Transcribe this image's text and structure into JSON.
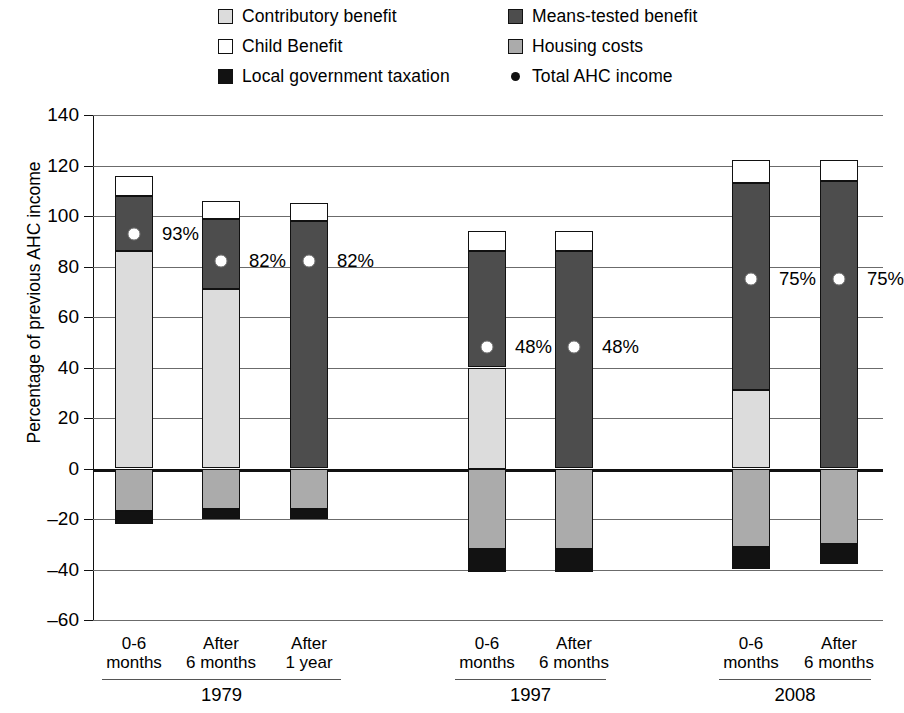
{
  "legend": {
    "items": [
      {
        "label": "Contributory benefit",
        "key": "contributory",
        "swatch": "square",
        "color": "#dcdcdc"
      },
      {
        "label": "Means-tested benefit",
        "key": "means",
        "swatch": "square",
        "color": "#4d4d4d"
      },
      {
        "label": "Child Benefit",
        "key": "child",
        "swatch": "square",
        "color": "#ffffff"
      },
      {
        "label": "Housing costs",
        "key": "housing",
        "swatch": "square",
        "color": "#ababab"
      },
      {
        "label": "Local government taxation",
        "key": "taxation",
        "swatch": "square",
        "color": "#121212"
      },
      {
        "label": "Total AHC income",
        "key": "ahc",
        "swatch": "dot",
        "color": "#111111"
      }
    ]
  },
  "chart_data": {
    "type": "bar",
    "title": "",
    "xlabel": "",
    "ylabel": "Percentage of previous AHC income",
    "ylim": [
      -60,
      140
    ],
    "yticks": [
      140,
      120,
      100,
      80,
      60,
      40,
      20,
      0,
      -20,
      -40,
      -60
    ],
    "ytick_labels": [
      "140",
      "120",
      "100",
      "80",
      "60",
      "40",
      "20",
      "0",
      "–20",
      "–40",
      "–60"
    ],
    "grid": true,
    "stacked": true,
    "legend_position": "top",
    "categories": [
      "0-6 months",
      "After 6 months",
      "After 1 year",
      "0-6 months",
      "After 6 months",
      "0-6 months",
      "After 6 months"
    ],
    "category_lines": [
      [
        "0-6",
        "months"
      ],
      [
        "After",
        "6 months"
      ],
      [
        "After",
        "1 year"
      ],
      [
        "0-6",
        "months"
      ],
      [
        "After",
        "6 months"
      ],
      [
        "0-6",
        "months"
      ],
      [
        "After",
        "6 months"
      ]
    ],
    "groups": [
      {
        "label": "1979",
        "bars": [
          0,
          1,
          2
        ]
      },
      {
        "label": "1997",
        "bars": [
          3,
          4
        ]
      },
      {
        "label": "2008",
        "bars": [
          5,
          6
        ]
      }
    ],
    "series": [
      {
        "name": "Contributory benefit",
        "key": "contributory",
        "color": "#dcdcdc",
        "values": [
          86,
          71,
          0,
          40,
          0,
          31,
          0
        ]
      },
      {
        "name": "Means-tested benefit",
        "key": "means",
        "color": "#4d4d4d",
        "values": [
          22,
          28,
          98,
          46,
          86,
          82,
          114
        ]
      },
      {
        "name": "Child Benefit",
        "key": "child",
        "color": "#ffffff",
        "values": [
          8,
          7,
          7,
          8,
          8,
          9,
          8
        ]
      },
      {
        "name": "Housing costs",
        "key": "housing",
        "color": "#ababab",
        "values": [
          -17,
          -16,
          -16,
          -32,
          -32,
          -31,
          -30
        ]
      },
      {
        "name": "Local government taxation",
        "key": "taxation",
        "color": "#121212",
        "values": [
          -5,
          -4,
          -4,
          -9,
          -9,
          -9,
          -8
        ]
      }
    ],
    "totals_positive": [
      116,
      106,
      105,
      94,
      94,
      122,
      122
    ],
    "ahc_income": {
      "name": "Total AHC income",
      "values": [
        93,
        82,
        82,
        48,
        48,
        75,
        75
      ],
      "labels": [
        "93%",
        "82%",
        "82%",
        "48%",
        "48%",
        "75%",
        "75%"
      ]
    }
  }
}
